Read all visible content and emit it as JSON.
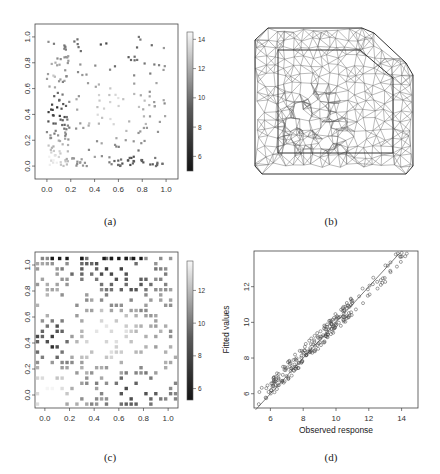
{
  "figure": {
    "captions": {
      "a": "(a)",
      "b": "(b)",
      "c": "(c)",
      "d": "(d)"
    }
  },
  "chart_data": [
    {
      "id": "a",
      "type": "scatter",
      "title": "",
      "xlabel": "",
      "ylabel": "",
      "xlim": [
        -0.1,
        1.1
      ],
      "ylim": [
        -0.1,
        1.1
      ],
      "xticks": [
        "0.0",
        "0.2",
        "0.4",
        "0.6",
        "0.8",
        "1.0"
      ],
      "yticks": [
        "0.0",
        "0.2",
        "0.4",
        "0.6",
        "0.8",
        "1.0"
      ],
      "grid": false,
      "colorbar": {
        "ticks": [
          "6",
          "8",
          "10",
          "12",
          "14"
        ],
        "range": [
          5,
          14.5
        ],
        "colormap": "grayscale (black=low, white=high)"
      },
      "points_note": "approx. 250 small square markers, gray-shaded by response value; dark points cluster near x<0.2, y 0.3-0.55 and along upper/bottom edges; light points concentrated near origin and centre"
    },
    {
      "id": "b",
      "type": "diagram",
      "title": "",
      "description": "Triangular mesh over the domain: inner rectangular boundary with cut top-right corner, outer extended boundary with rounded corners; denser triangulation in lower-left interior"
    },
    {
      "id": "c",
      "type": "scatter",
      "title": "",
      "xlabel": "",
      "ylabel": "",
      "xlim": [
        -0.08,
        1.08
      ],
      "ylim": [
        -0.1,
        1.1
      ],
      "xticks": [
        "0.0",
        "0.2",
        "0.4",
        "0.6",
        "0.8",
        "1.0"
      ],
      "yticks": [
        "0.0",
        "0.2",
        "0.4",
        "0.6",
        "0.8",
        "1.0"
      ],
      "grid": false,
      "colorbar": {
        "ticks": [
          "6",
          "8",
          "10",
          "12"
        ],
        "range": [
          5.3,
          13.8
        ],
        "colormap": "grayscale (black=low, white=high)"
      },
      "points_note": "gridded square markers (predicted values on lattice), dark squares along top row and lower-right, light squares in centre"
    },
    {
      "id": "d",
      "type": "scatter",
      "title": "",
      "xlabel": "Observed response",
      "ylabel": "Fitted values",
      "xlim": [
        5,
        15
      ],
      "ylim": [
        5.2,
        14
      ],
      "xticks": [
        "6",
        "8",
        "10",
        "12",
        "14"
      ],
      "yticks": [
        "6",
        "8",
        "10",
        "12"
      ],
      "grid": false,
      "reference_line": {
        "slope": 1,
        "intercept": 0
      },
      "marker": "open circle",
      "points_note": "approx. 250 points scattered tightly around the y=x line, from ~(5.2,5.5) to ~(14.6,13.5)"
    }
  ]
}
